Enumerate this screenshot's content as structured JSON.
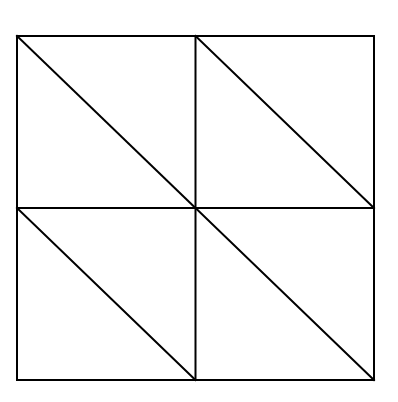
{
  "diagram": {
    "grid": {
      "rows": 2,
      "cols": 2
    },
    "diagonal_direction": "top-left-to-bottom-right",
    "stroke_color": "#000000",
    "background_color": "#ffffff",
    "cells": [
      {
        "row": 0,
        "col": 0,
        "diagonal": true
      },
      {
        "row": 0,
        "col": 1,
        "diagonal": true
      },
      {
        "row": 1,
        "col": 0,
        "diagonal": true
      },
      {
        "row": 1,
        "col": 1,
        "diagonal": true
      }
    ]
  }
}
